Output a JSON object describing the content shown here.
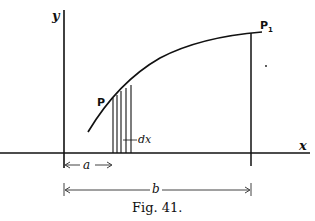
{
  "figure": {
    "caption": "Fig. 41.",
    "axes": {
      "x_label": "x",
      "y_label": "y"
    },
    "points": {
      "start": "P",
      "end": "P",
      "end_subscript": "1"
    },
    "dimensions": {
      "a_label": "a",
      "b_label": "b",
      "strip_label": "dx"
    },
    "colors": {
      "ink": "#111111",
      "background": "#ffffff"
    }
  }
}
